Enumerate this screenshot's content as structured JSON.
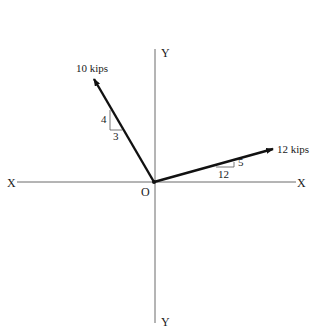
{
  "diagram": {
    "type": "force vector diagram",
    "origin_label": "O",
    "axes": {
      "x_left_label": "X",
      "x_right_label": "X",
      "y_top_label": "Y",
      "y_bottom_label": "Y",
      "color": "#6a6a6a"
    },
    "forces": [
      {
        "label": "10 kips",
        "magnitude": 10,
        "unit": "kips",
        "direction": "up-left",
        "slope": {
          "rise_label": "4",
          "run_label": "3"
        }
      },
      {
        "label": "12 kips",
        "magnitude": 12,
        "unit": "kips",
        "direction": "up-right",
        "slope": {
          "rise_label": "5",
          "run_label": "12"
        }
      }
    ],
    "vector_color": "#111111"
  }
}
